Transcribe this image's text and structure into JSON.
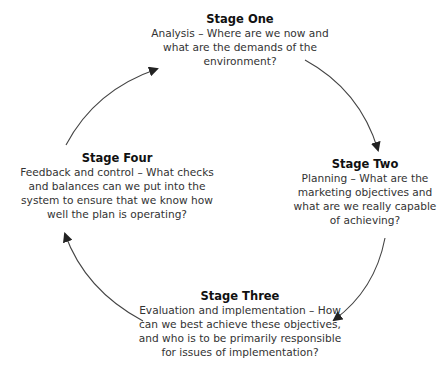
{
  "diagram": {
    "type": "cycle",
    "stages": [
      {
        "title": "Stage One",
        "description": "Analysis – Where are we now and what are the demands of the environment?"
      },
      {
        "title": "Stage Two",
        "description": "Planning – What are the marketing objectives and what are we really capable of achieving?"
      },
      {
        "title": "Stage Three",
        "description": "Evaluation and implementation – How can we best achieve these objectives, and who is to be primarily responsible for issues of implementation?"
      },
      {
        "title": "Stage Four",
        "description": "Feedback and control – What checks and balances can we put into the system to ensure that we know how well the plan is operating?"
      }
    ],
    "arrows": [
      {
        "from": "Stage One",
        "to": "Stage Two",
        "direction": "clockwise"
      },
      {
        "from": "Stage Two",
        "to": "Stage Three",
        "direction": "clockwise"
      },
      {
        "from": "Stage Three",
        "to": "Stage Four",
        "direction": "clockwise"
      },
      {
        "from": "Stage Four",
        "to": "Stage One",
        "direction": "clockwise"
      }
    ],
    "colors": {
      "text": "#222222",
      "arrow": "#333333",
      "background": "#ffffff"
    }
  }
}
